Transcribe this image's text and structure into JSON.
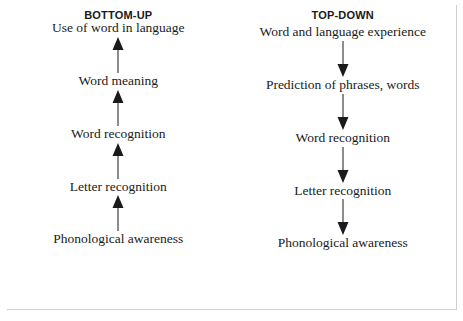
{
  "figure": {
    "border_color": "#3a3a3a",
    "background": "#ffffff",
    "text_color": "#1a1a1a"
  },
  "columns": [
    {
      "id": "bottom-up",
      "heading": "BOTTOM-UP",
      "arrow_direction": "up",
      "stages": [
        "Use of word in language",
        "Word meaning",
        "Word recognition",
        "Letter recognition",
        "Phonological awareness"
      ]
    },
    {
      "id": "top-down",
      "heading": "TOP-DOWN",
      "arrow_direction": "down",
      "stages": [
        "Word and language experience",
        "Prediction of phrases, words",
        "Word recognition",
        "Letter recognition",
        "Phonological awareness"
      ]
    }
  ]
}
